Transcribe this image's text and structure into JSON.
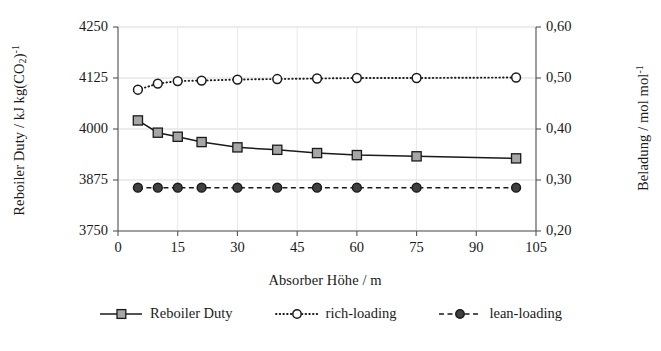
{
  "chart_data": {
    "type": "line",
    "title": "",
    "xlabel": "Absorber Höhe / m",
    "ylabel": "Reboiler Duty / kJ kg(CO2)-1",
    "ylabel_parts": {
      "prefix": "Reboiler Duty / kJ kg(CO",
      "sub": "2",
      "mid": ")",
      "sup": "-1"
    },
    "y2label": "Beladung / mol mol-1",
    "y2label_parts": {
      "prefix": "Beladung / mol mol",
      "sup": "-1"
    },
    "xlim": [
      0,
      105
    ],
    "ylim": [
      3750,
      4250
    ],
    "y2lim": [
      0.2,
      0.6
    ],
    "xticks": [
      0,
      15,
      30,
      45,
      60,
      75,
      90,
      105
    ],
    "xticklabels": [
      "0",
      "15",
      "30",
      "45",
      "60",
      "75",
      "90",
      "105"
    ],
    "yticks": [
      3750,
      3875,
      4000,
      4125,
      4250
    ],
    "yticklabels": [
      "3750",
      "3875",
      "4000",
      "4125",
      "4250"
    ],
    "y2ticks": [
      0.2,
      0.3,
      0.4,
      0.5,
      0.6
    ],
    "y2ticklabels": [
      "0,20",
      "0,30",
      "0,40",
      "0,50",
      "0,60"
    ],
    "grid": true,
    "grid_color": "#d9d9d9",
    "legend_position": "bottom",
    "x": [
      5,
      10,
      15,
      21,
      30,
      40,
      50,
      60,
      75,
      100
    ],
    "series": [
      {
        "name": "Reboiler Duty",
        "axis": "left",
        "marker": "square-filled-gray",
        "linestyle": "solid",
        "color": "#1a1a1a",
        "marker_fill": "#a6a6a6",
        "values": [
          4021,
          3991,
          3981,
          3968,
          3955,
          3949,
          3941,
          3936,
          3933,
          3928
        ]
      },
      {
        "name": "rich-loading",
        "axis": "right",
        "marker": "circle-open",
        "linestyle": "dotted",
        "color": "#1a1a1a",
        "marker_fill": "#ffffff",
        "values": [
          0.477,
          0.489,
          0.494,
          0.495,
          0.497,
          0.498,
          0.499,
          0.5,
          0.5,
          0.501
        ]
      },
      {
        "name": "lean-loading",
        "axis": "right",
        "marker": "circle-filled",
        "linestyle": "dashed",
        "color": "#1a1a1a",
        "marker_fill": "#404040",
        "values": [
          0.285,
          0.285,
          0.285,
          0.285,
          0.285,
          0.285,
          0.285,
          0.285,
          0.285,
          0.285
        ]
      }
    ]
  },
  "legend": {
    "items": [
      {
        "label": "Reboiler Duty"
      },
      {
        "label": "rich-loading"
      },
      {
        "label": "lean-loading"
      }
    ]
  }
}
